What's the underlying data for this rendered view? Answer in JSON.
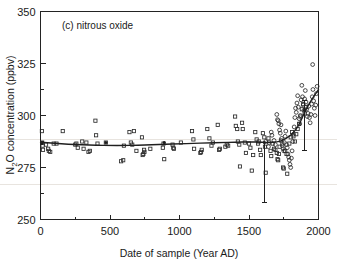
{
  "figure": {
    "panel_label": "(c) nitrous oxide",
    "background_color": "#ffffff",
    "ink_color": "#1f1f1f"
  },
  "chart_data": {
    "type": "scatter",
    "title": "(c) nitrous oxide",
    "xlabel": "Date of sample (Year AD)",
    "ylabel": "N2O concentration (ppbv)",
    "ylabel_display": "N₂O concentration (ppbv)",
    "xlim": [
      0,
      2000
    ],
    "ylim": [
      250,
      350
    ],
    "xticks": [
      0,
      500,
      1000,
      1500,
      2000
    ],
    "xticklabels": [
      "0",
      "500",
      "1000",
      "1500",
      "2000"
    ],
    "xminorticks": [
      250,
      750,
      1250,
      1750
    ],
    "yticks": [
      250,
      275,
      300,
      325,
      350
    ],
    "yticklabels": [
      "250",
      "275",
      "300",
      "325",
      "350"
    ],
    "yminorticks": [
      262.5,
      287.5,
      312.5
    ],
    "grid": false,
    "legend": null,
    "series": [
      {
        "name": "ice core samples (open squares)",
        "marker": "open-square",
        "points": [
          [
            10,
            292.5
          ],
          [
            12,
            287.0
          ],
          [
            15,
            285.5
          ],
          [
            18,
            283.5
          ],
          [
            40,
            286.0
          ],
          [
            55,
            284.0
          ],
          [
            60,
            283.0
          ],
          [
            70,
            282.5
          ],
          [
            95,
            286.5
          ],
          [
            115,
            286.5
          ],
          [
            160,
            292.5
          ],
          [
            250,
            286.0
          ],
          [
            258,
            286.5
          ],
          [
            268,
            284.5
          ],
          [
            300,
            287.5
          ],
          [
            310,
            284.0
          ],
          [
            330,
            287.0
          ],
          [
            345,
            282.5
          ],
          [
            355,
            283.0
          ],
          [
            395,
            297.5
          ],
          [
            400,
            290.5
          ],
          [
            410,
            286.5
          ],
          [
            470,
            287.0
          ],
          [
            580,
            278.0
          ],
          [
            595,
            278.5
          ],
          [
            600,
            285.5
          ],
          [
            640,
            292.0
          ],
          [
            650,
            287.0
          ],
          [
            660,
            286.0
          ],
          [
            672,
            292.5
          ],
          [
            690,
            283.0
          ],
          [
            730,
            289.5
          ],
          [
            735,
            281.0
          ],
          [
            740,
            281.5
          ],
          [
            745,
            283.5
          ],
          [
            748,
            282.5
          ],
          [
            790,
            284.0
          ],
          [
            880,
            284.5
          ],
          [
            885,
            286.5
          ],
          [
            890,
            279.0
          ],
          [
            950,
            286.0
          ],
          [
            955,
            284.5
          ],
          [
            960,
            284.0
          ],
          [
            1010,
            287.0
          ],
          [
            1090,
            292.5
          ],
          [
            1100,
            288.5
          ],
          [
            1105,
            284.0
          ],
          [
            1150,
            282.0
          ],
          [
            1155,
            282.5
          ],
          [
            1160,
            283.5
          ],
          [
            1200,
            293.5
          ],
          [
            1215,
            289.0
          ],
          [
            1230,
            285.5
          ],
          [
            1240,
            287.0
          ],
          [
            1275,
            295.5
          ],
          [
            1285,
            283.5
          ],
          [
            1290,
            284.0
          ],
          [
            1330,
            285.0
          ],
          [
            1340,
            286.0
          ],
          [
            1350,
            285.5
          ],
          [
            1400,
            299.5
          ],
          [
            1405,
            295.0
          ],
          [
            1415,
            293.5
          ],
          [
            1420,
            287.5
          ],
          [
            1430,
            286.0
          ],
          [
            1435,
            275.5
          ],
          [
            1450,
            296.5
          ],
          [
            1455,
            293.5
          ],
          [
            1470,
            287.0
          ],
          [
            1478,
            282.0
          ],
          [
            1500,
            286.5
          ],
          [
            1510,
            284.5
          ],
          [
            1520,
            273.5
          ],
          [
            1530,
            281.0
          ],
          [
            1545,
            292.0
          ],
          [
            1555,
            288.5
          ],
          [
            1565,
            286.5
          ],
          [
            1570,
            287.5
          ],
          [
            1580,
            283.5
          ],
          [
            1585,
            281.0
          ],
          [
            1600,
            291.5
          ],
          [
            1610,
            289.5
          ],
          [
            1615,
            285.0
          ],
          [
            1620,
            272.5
          ],
          [
            1640,
            289.0
          ],
          [
            1645,
            287.0
          ],
          [
            1655,
            283.0
          ],
          [
            1660,
            280.5
          ],
          [
            1670,
            286.5
          ],
          [
            1680,
            284.0
          ],
          [
            1690,
            283.5
          ],
          [
            1700,
            282.0
          ],
          [
            1705,
            279.0
          ],
          [
            1710,
            278.5
          ],
          [
            1715,
            281.5
          ],
          [
            1720,
            285.0
          ],
          [
            1730,
            288.0
          ],
          [
            1740,
            286.5
          ],
          [
            1745,
            275.0
          ],
          [
            1750,
            274.5
          ],
          [
            1760,
            283.0
          ],
          [
            1770,
            281.5
          ],
          [
            1775,
            272.0
          ],
          [
            1790,
            286.5
          ],
          [
            1800,
            289.5
          ],
          [
            1810,
            292.0
          ],
          [
            1820,
            290.0
          ],
          [
            1830,
            287.5
          ],
          [
            1840,
            291.0
          ],
          [
            1850,
            293.5
          ],
          [
            1860,
            296.0
          ],
          [
            1870,
            299.5
          ],
          [
            1880,
            303.0
          ],
          [
            1890,
            305.5
          ],
          [
            1900,
            301.0
          ],
          [
            1910,
            304.0
          ]
        ]
      },
      {
        "name": "firn / recent samples (open circles)",
        "marker": "open-circle",
        "points": [
          [
            1620,
            287.5
          ],
          [
            1640,
            285.0
          ],
          [
            1660,
            292.0
          ],
          [
            1665,
            290.5
          ],
          [
            1680,
            288.0
          ],
          [
            1690,
            286.0
          ],
          [
            1700,
            300.5
          ],
          [
            1705,
            298.0
          ],
          [
            1710,
            297.5
          ],
          [
            1715,
            296.0
          ],
          [
            1720,
            293.0
          ],
          [
            1725,
            291.5
          ],
          [
            1730,
            295.5
          ],
          [
            1735,
            289.0
          ],
          [
            1740,
            285.5
          ],
          [
            1745,
            284.0
          ],
          [
            1750,
            283.0
          ],
          [
            1755,
            287.0
          ],
          [
            1760,
            290.0
          ],
          [
            1765,
            292.5
          ],
          [
            1770,
            286.0
          ],
          [
            1775,
            284.5
          ],
          [
            1780,
            281.5
          ],
          [
            1785,
            280.0
          ],
          [
            1790,
            278.5
          ],
          [
            1795,
            276.5
          ],
          [
            1800,
            275.0
          ],
          [
            1805,
            279.5
          ],
          [
            1810,
            283.0
          ],
          [
            1815,
            287.5
          ],
          [
            1820,
            291.0
          ],
          [
            1825,
            294.5
          ],
          [
            1830,
            299.0
          ],
          [
            1835,
            303.5
          ],
          [
            1840,
            301.5
          ],
          [
            1845,
            306.0
          ],
          [
            1850,
            309.5
          ],
          [
            1855,
            304.0
          ],
          [
            1860,
            298.5
          ],
          [
            1865,
            296.0
          ],
          [
            1870,
            300.0
          ],
          [
            1875,
            307.5
          ],
          [
            1880,
            314.5
          ],
          [
            1885,
            309.0
          ],
          [
            1890,
            305.0
          ],
          [
            1895,
            302.5
          ],
          [
            1900,
            308.0
          ],
          [
            1905,
            312.0
          ],
          [
            1910,
            306.5
          ],
          [
            1915,
            303.0
          ],
          [
            1920,
            299.5
          ],
          [
            1925,
            301.0
          ],
          [
            1930,
            304.5
          ],
          [
            1935,
            299.0
          ],
          [
            1940,
            296.5
          ],
          [
            1945,
            300.5
          ],
          [
            1950,
            305.5
          ],
          [
            1955,
            309.0
          ],
          [
            1958,
            324.5
          ],
          [
            1960,
            312.5
          ],
          [
            1965,
            307.0
          ],
          [
            1970,
            303.5
          ],
          [
            1975,
            300.0
          ],
          [
            1980,
            305.0
          ],
          [
            1985,
            310.5
          ],
          [
            1990,
            314.0
          ]
        ]
      },
      {
        "name": "anchor means (filled dots)",
        "marker": "filled-dot",
        "points": [
          [
            10,
            286.5
          ],
          [
            470,
            287.0
          ],
          [
            890,
            287.0
          ],
          [
            1610,
            287.0
          ],
          [
            1900,
            302.5
          ]
        ]
      }
    ],
    "trend_line": {
      "name": "smoothed fit",
      "points": [
        [
          0,
          287.2
        ],
        [
          100,
          286.6
        ],
        [
          200,
          286.2
        ],
        [
          300,
          285.9
        ],
        [
          400,
          285.7
        ],
        [
          500,
          285.6
        ],
        [
          600,
          285.6
        ],
        [
          700,
          285.7
        ],
        [
          800,
          285.9
        ],
        [
          900,
          286.2
        ],
        [
          1000,
          286.4
        ],
        [
          1100,
          286.6
        ],
        [
          1200,
          286.8
        ],
        [
          1300,
          287.0
        ],
        [
          1400,
          287.2
        ],
        [
          1500,
          287.3
        ],
        [
          1600,
          287.2
        ],
        [
          1650,
          287.0
        ],
        [
          1700,
          287.2
        ],
        [
          1750,
          288.2
        ],
        [
          1800,
          290.5
        ],
        [
          1830,
          292.5
        ],
        [
          1860,
          295.5
        ],
        [
          1880,
          298.5
        ],
        [
          1900,
          301.5
        ],
        [
          1920,
          304.0
        ],
        [
          1940,
          306.5
        ],
        [
          1960,
          308.5
        ],
        [
          1980,
          310.5
        ],
        [
          2000,
          312.5
        ]
      ]
    },
    "error_bars": [
      {
        "x": 1610,
        "y": 287.0,
        "low": 258.0,
        "high": 287.0,
        "cap_width": 5
      },
      {
        "x": 1900,
        "y": 295.0,
        "low": 283.0,
        "high": 307.0,
        "cap_width": 5
      }
    ]
  }
}
